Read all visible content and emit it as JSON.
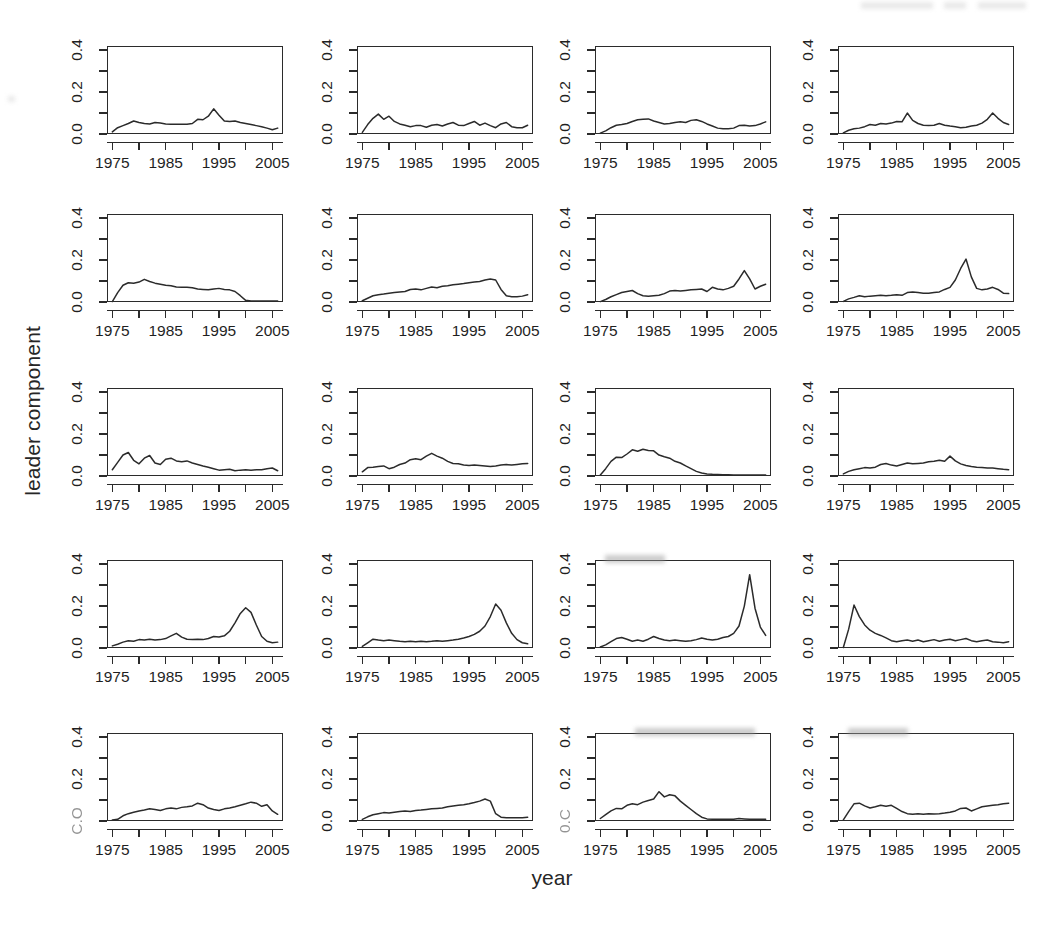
{
  "figure": {
    "xlabel": "year",
    "ylabel": "leader component",
    "rows": 5,
    "cols": 4,
    "panel_count": 20
  },
  "axes": {
    "y_tick_labels": [
      "0.0",
      "0.2",
      "0.4"
    ],
    "y_tick_values": [
      0.0,
      0.1,
      0.2,
      0.3,
      0.4
    ],
    "y_labeled_values": [
      0.0,
      0.2,
      0.4
    ],
    "x_tick_labels": [
      "1975",
      "1985",
      "1995",
      "2005"
    ],
    "x_tick_values": [
      1975,
      1980,
      1985,
      1990,
      1995,
      2000,
      2005
    ],
    "x_labeled_values": [
      1975,
      1985,
      1995,
      2005
    ],
    "ylim": [
      0.0,
      0.42
    ],
    "xlim": [
      1974,
      2007
    ],
    "line_color": "#2b2b2b",
    "axis_color": "#2b2b2b",
    "background": "#ffffff"
  },
  "chart_data": {
    "type": "line",
    "title": "",
    "xlabel": "year",
    "ylabel": "leader component",
    "xlim": [
      1974,
      2007
    ],
    "ylim": [
      0.0,
      0.42
    ],
    "grid": false,
    "legend": "none",
    "layout": "small-multiples 5 rows x 4 columns",
    "x": [
      1975,
      1976,
      1977,
      1978,
      1979,
      1980,
      1981,
      1982,
      1983,
      1984,
      1985,
      1986,
      1987,
      1988,
      1989,
      1990,
      1991,
      1992,
      1993,
      1994,
      1995,
      1996,
      1997,
      1998,
      1999,
      2000,
      2001,
      2002,
      2003,
      2004,
      2005,
      2006
    ],
    "panels": [
      {
        "index": 1,
        "row": 1,
        "col": 1,
        "y_tick_labels": [
          "0.0",
          "0.2",
          "0.4"
        ],
        "x_tick_labels": [
          "1975",
          "1985",
          "1995",
          "2005"
        ],
        "values": [
          0.01,
          0.03,
          0.04,
          0.05,
          0.062,
          0.055,
          0.05,
          0.048,
          0.055,
          0.052,
          0.048,
          0.046,
          0.046,
          0.046,
          0.046,
          0.05,
          0.07,
          0.068,
          0.085,
          0.12,
          0.09,
          0.062,
          0.06,
          0.062,
          0.055,
          0.05,
          0.045,
          0.04,
          0.035,
          0.028,
          0.02,
          0.028
        ]
      },
      {
        "index": 2,
        "row": 1,
        "col": 2,
        "y_tick_labels": [
          "0.0",
          "0.2",
          "0.4"
        ],
        "x_tick_labels": [
          "1975",
          "1985",
          "1995",
          "2005"
        ],
        "values": [
          0.008,
          0.045,
          0.075,
          0.095,
          0.07,
          0.085,
          0.06,
          0.048,
          0.042,
          0.035,
          0.04,
          0.04,
          0.032,
          0.042,
          0.045,
          0.038,
          0.048,
          0.055,
          0.042,
          0.04,
          0.05,
          0.06,
          0.042,
          0.052,
          0.04,
          0.03,
          0.048,
          0.055,
          0.035,
          0.03,
          0.03,
          0.042
        ]
      },
      {
        "index": 3,
        "row": 1,
        "col": 3,
        "y_tick_labels": [
          "0.0",
          "0.2",
          "0.4"
        ],
        "x_tick_labels": [
          "1975",
          "1985",
          "1995",
          "2005"
        ],
        "values": [
          0.004,
          0.015,
          0.03,
          0.042,
          0.045,
          0.05,
          0.06,
          0.068,
          0.07,
          0.072,
          0.062,
          0.055,
          0.048,
          0.05,
          0.055,
          0.058,
          0.055,
          0.065,
          0.068,
          0.06,
          0.048,
          0.038,
          0.028,
          0.025,
          0.025,
          0.028,
          0.04,
          0.042,
          0.038,
          0.04,
          0.048,
          0.058
        ]
      },
      {
        "index": 4,
        "row": 1,
        "col": 4,
        "y_tick_labels": [
          "0.0",
          "0.2",
          "0.4"
        ],
        "x_tick_labels": [
          "1975",
          "1985",
          "1995",
          "2005"
        ],
        "values": [
          0.005,
          0.018,
          0.025,
          0.028,
          0.035,
          0.045,
          0.042,
          0.05,
          0.048,
          0.052,
          0.06,
          0.058,
          0.1,
          0.065,
          0.05,
          0.042,
          0.04,
          0.042,
          0.05,
          0.042,
          0.038,
          0.035,
          0.03,
          0.032,
          0.038,
          0.042,
          0.052,
          0.07,
          0.1,
          0.075,
          0.055,
          0.045
        ]
      },
      {
        "index": 5,
        "row": 2,
        "col": 1,
        "y_tick_labels": [
          "0.0",
          "0.2",
          "0.4"
        ],
        "x_tick_labels": [
          "1975",
          "1985",
          "1995",
          "2005"
        ],
        "values": [
          0.002,
          0.045,
          0.08,
          0.092,
          0.09,
          0.095,
          0.108,
          0.098,
          0.09,
          0.085,
          0.08,
          0.078,
          0.072,
          0.07,
          0.07,
          0.068,
          0.062,
          0.06,
          0.058,
          0.062,
          0.065,
          0.06,
          0.058,
          0.05,
          0.03,
          0.008,
          0.005,
          0.005,
          0.005,
          0.005,
          0.005,
          0.005
        ]
      },
      {
        "index": 6,
        "row": 2,
        "col": 2,
        "y_tick_labels": [
          "0.0",
          "0.2",
          "0.4"
        ],
        "x_tick_labels": [
          "1975",
          "1985",
          "1995",
          "2005"
        ],
        "values": [
          0.006,
          0.018,
          0.03,
          0.035,
          0.038,
          0.042,
          0.045,
          0.048,
          0.05,
          0.06,
          0.062,
          0.058,
          0.065,
          0.072,
          0.068,
          0.075,
          0.078,
          0.082,
          0.085,
          0.088,
          0.092,
          0.095,
          0.098,
          0.105,
          0.11,
          0.105,
          0.06,
          0.03,
          0.025,
          0.025,
          0.028,
          0.035
        ]
      },
      {
        "index": 7,
        "row": 2,
        "col": 3,
        "y_tick_labels": [
          "0.0",
          "0.2",
          "0.4"
        ],
        "x_tick_labels": [
          "1975",
          "1985",
          "1995",
          "2005"
        ],
        "values": [
          0.002,
          0.012,
          0.025,
          0.035,
          0.045,
          0.05,
          0.055,
          0.04,
          0.03,
          0.028,
          0.03,
          0.032,
          0.04,
          0.052,
          0.055,
          0.052,
          0.055,
          0.058,
          0.06,
          0.062,
          0.05,
          0.07,
          0.062,
          0.058,
          0.065,
          0.075,
          0.11,
          0.15,
          0.11,
          0.062,
          0.075,
          0.085
        ]
      },
      {
        "index": 8,
        "row": 2,
        "col": 4,
        "y_tick_labels": [
          "0.0",
          "0.2",
          "0.4"
        ],
        "x_tick_labels": [
          "1975",
          "1985",
          "1995",
          "2005"
        ],
        "values": [
          0.003,
          0.015,
          0.022,
          0.03,
          0.025,
          0.028,
          0.03,
          0.032,
          0.03,
          0.032,
          0.035,
          0.032,
          0.045,
          0.048,
          0.045,
          0.042,
          0.042,
          0.045,
          0.048,
          0.06,
          0.07,
          0.105,
          0.16,
          0.205,
          0.12,
          0.065,
          0.058,
          0.062,
          0.07,
          0.06,
          0.042,
          0.04
        ]
      },
      {
        "index": 9,
        "row": 3,
        "col": 1,
        "y_tick_labels": [
          "0.0",
          "0.2",
          "0.4"
        ],
        "x_tick_labels": [
          "1975",
          "1985",
          "1995",
          "2005"
        ],
        "values": [
          0.03,
          0.065,
          0.1,
          0.112,
          0.075,
          0.058,
          0.085,
          0.098,
          0.062,
          0.055,
          0.08,
          0.085,
          0.072,
          0.068,
          0.072,
          0.062,
          0.055,
          0.048,
          0.042,
          0.035,
          0.028,
          0.03,
          0.032,
          0.025,
          0.028,
          0.03,
          0.028,
          0.03,
          0.03,
          0.035,
          0.038,
          0.025
        ]
      },
      {
        "index": 10,
        "row": 3,
        "col": 2,
        "y_tick_labels": [
          "0.0",
          "0.2",
          "0.4"
        ],
        "x_tick_labels": [
          "1975",
          "1985",
          "1995",
          "2005"
        ],
        "values": [
          0.02,
          0.04,
          0.042,
          0.045,
          0.048,
          0.035,
          0.042,
          0.055,
          0.062,
          0.078,
          0.082,
          0.078,
          0.095,
          0.108,
          0.095,
          0.085,
          0.07,
          0.06,
          0.058,
          0.052,
          0.05,
          0.052,
          0.05,
          0.048,
          0.045,
          0.048,
          0.052,
          0.055,
          0.052,
          0.055,
          0.058,
          0.06
        ]
      },
      {
        "index": 11,
        "row": 3,
        "col": 3,
        "y_tick_labels": [
          "0.0",
          "0.2",
          "0.4"
        ],
        "x_tick_labels": [
          "1975",
          "1985",
          "1995",
          "2005"
        ],
        "values": [
          0.005,
          0.035,
          0.07,
          0.09,
          0.088,
          0.105,
          0.125,
          0.118,
          0.128,
          0.122,
          0.12,
          0.1,
          0.092,
          0.085,
          0.07,
          0.062,
          0.048,
          0.035,
          0.022,
          0.014,
          0.01,
          0.008,
          0.007,
          0.006,
          0.006,
          0.005,
          0.005,
          0.005,
          0.005,
          0.005,
          0.005,
          0.005
        ]
      },
      {
        "index": 12,
        "row": 3,
        "col": 4,
        "y_tick_labels": [
          "0.0",
          "0.2",
          "0.4"
        ],
        "x_tick_labels": [
          "1975",
          "1985",
          "1995",
          "2005"
        ],
        "values": [
          0.01,
          0.022,
          0.03,
          0.035,
          0.04,
          0.038,
          0.042,
          0.055,
          0.06,
          0.052,
          0.048,
          0.055,
          0.062,
          0.058,
          0.06,
          0.062,
          0.068,
          0.07,
          0.075,
          0.07,
          0.095,
          0.072,
          0.058,
          0.05,
          0.045,
          0.042,
          0.04,
          0.038,
          0.038,
          0.035,
          0.032,
          0.03
        ]
      },
      {
        "index": 13,
        "row": 4,
        "col": 1,
        "y_tick_labels": [
          "0.0",
          "0.2",
          "0.4"
        ],
        "x_tick_labels": [
          "1975",
          "1985",
          "1995",
          "2005"
        ],
        "values": [
          0.01,
          0.018,
          0.028,
          0.035,
          0.032,
          0.04,
          0.038,
          0.042,
          0.038,
          0.04,
          0.045,
          0.058,
          0.07,
          0.052,
          0.042,
          0.04,
          0.042,
          0.04,
          0.045,
          0.055,
          0.052,
          0.058,
          0.08,
          0.12,
          0.165,
          0.192,
          0.17,
          0.11,
          0.055,
          0.032,
          0.025,
          0.028
        ]
      },
      {
        "index": 14,
        "row": 4,
        "col": 2,
        "y_tick_labels": [
          "0.0",
          "0.2",
          "0.4"
        ],
        "x_tick_labels": [
          "1975",
          "1985",
          "1995",
          "2005"
        ],
        "values": [
          0.008,
          0.025,
          0.042,
          0.038,
          0.035,
          0.038,
          0.035,
          0.032,
          0.03,
          0.032,
          0.03,
          0.032,
          0.03,
          0.032,
          0.035,
          0.032,
          0.035,
          0.038,
          0.042,
          0.048,
          0.055,
          0.065,
          0.08,
          0.105,
          0.15,
          0.21,
          0.18,
          0.12,
          0.07,
          0.04,
          0.025,
          0.02
        ]
      },
      {
        "index": 15,
        "row": 4,
        "col": 3,
        "y_tick_labels": [
          "0.0",
          "0.2",
          "0.4"
        ],
        "x_tick_labels": [
          "1975",
          "1985",
          "1995",
          "2005"
        ],
        "values": [
          0.005,
          0.015,
          0.03,
          0.045,
          0.05,
          0.042,
          0.032,
          0.038,
          0.032,
          0.042,
          0.055,
          0.045,
          0.038,
          0.035,
          0.038,
          0.035,
          0.032,
          0.035,
          0.04,
          0.048,
          0.042,
          0.038,
          0.042,
          0.05,
          0.055,
          0.07,
          0.105,
          0.2,
          0.35,
          0.19,
          0.1,
          0.06
        ]
      },
      {
        "index": 16,
        "row": 4,
        "col": 4,
        "y_tick_labels": [
          "0.0",
          "0.2",
          "0.4"
        ],
        "x_tick_labels": [
          "1975",
          "1985",
          "1995",
          "2005"
        ],
        "values": [
          0.002,
          0.09,
          0.205,
          0.15,
          0.11,
          0.085,
          0.07,
          0.06,
          0.048,
          0.035,
          0.03,
          0.035,
          0.038,
          0.032,
          0.038,
          0.03,
          0.035,
          0.04,
          0.032,
          0.038,
          0.042,
          0.035,
          0.04,
          0.045,
          0.035,
          0.03,
          0.035,
          0.038,
          0.03,
          0.028,
          0.025,
          0.03
        ]
      },
      {
        "index": 17,
        "row": 5,
        "col": 1,
        "y_tick_labels": [
          "C.O",
          "0.2",
          "0.4"
        ],
        "x_tick_labels": [
          "1975",
          "1985",
          "1995",
          "2005"
        ],
        "values": [
          0.005,
          0.008,
          0.025,
          0.035,
          0.042,
          0.048,
          0.052,
          0.058,
          0.055,
          0.05,
          0.058,
          0.062,
          0.058,
          0.065,
          0.068,
          0.072,
          0.085,
          0.078,
          0.062,
          0.055,
          0.05,
          0.058,
          0.062,
          0.068,
          0.075,
          0.082,
          0.09,
          0.085,
          0.07,
          0.078,
          0.048,
          0.032
        ]
      },
      {
        "index": 18,
        "row": 5,
        "col": 2,
        "y_tick_labels": [
          "0.0",
          "0.2",
          "0.4"
        ],
        "x_tick_labels": [
          "1975",
          "1985",
          "1995",
          "2005"
        ],
        "values": [
          0.008,
          0.02,
          0.03,
          0.035,
          0.04,
          0.038,
          0.042,
          0.045,
          0.048,
          0.045,
          0.05,
          0.052,
          0.055,
          0.058,
          0.06,
          0.062,
          0.068,
          0.072,
          0.075,
          0.078,
          0.082,
          0.088,
          0.095,
          0.105,
          0.095,
          0.035,
          0.018,
          0.015,
          0.015,
          0.015,
          0.015,
          0.018
        ]
      },
      {
        "index": 19,
        "row": 5,
        "col": 3,
        "y_tick_labels": [
          "0.C",
          "0.2",
          "0.4"
        ],
        "x_tick_labels": [
          "1975",
          "1985",
          "1995",
          "2005"
        ],
        "values": [
          0.012,
          0.03,
          0.048,
          0.06,
          0.058,
          0.075,
          0.082,
          0.078,
          0.09,
          0.098,
          0.105,
          0.14,
          0.115,
          0.125,
          0.12,
          0.095,
          0.075,
          0.055,
          0.035,
          0.018,
          0.01,
          0.008,
          0.008,
          0.008,
          0.008,
          0.008,
          0.012,
          0.01,
          0.008,
          0.008,
          0.008,
          0.008
        ]
      },
      {
        "index": 20,
        "row": 5,
        "col": 4,
        "y_tick_labels": [
          "0.0",
          "0.2",
          "0.4"
        ],
        "x_tick_labels": [
          "1975",
          "1985",
          "1995",
          "2005"
        ],
        "values": [
          0.005,
          0.045,
          0.082,
          0.085,
          0.072,
          0.062,
          0.068,
          0.075,
          0.07,
          0.075,
          0.06,
          0.045,
          0.035,
          0.032,
          0.035,
          0.032,
          0.035,
          0.033,
          0.035,
          0.038,
          0.042,
          0.048,
          0.06,
          0.062,
          0.048,
          0.058,
          0.068,
          0.072,
          0.075,
          0.078,
          0.082,
          0.085
        ]
      }
    ]
  }
}
